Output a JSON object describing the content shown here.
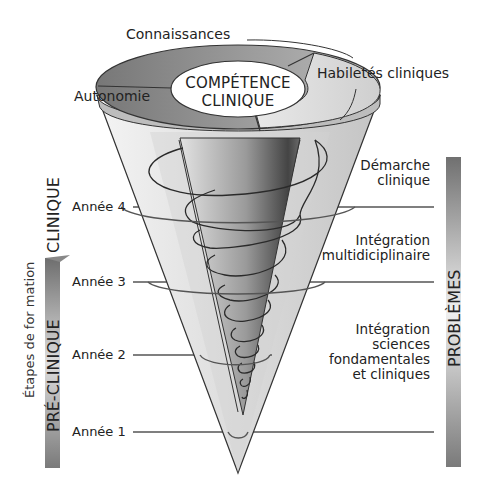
{
  "diagram": {
    "center": {
      "line1": "COMPÉTENCE",
      "line2": "CLINIQUE"
    },
    "rim_segments": {
      "top": "Connaissances",
      "right": "Habiletés cliniques",
      "left": "Autonomie"
    },
    "years": [
      "Année 4",
      "Année 3",
      "Année 2",
      "Année 1"
    ],
    "left_axis": {
      "title": "Étapes de for mation",
      "phase_clinical": "CLINIQUE",
      "phase_preclinical": "PRÉ-CLINIQUE"
    },
    "right_axis": {
      "title": "PROBLÈMES",
      "levels": [
        {
          "line1": "Démarche",
          "line2": "clinique"
        },
        {
          "line1": "Intégration",
          "line2": "multidiciplinaire"
        },
        {
          "line1": "Intégration",
          "line2": "sciences",
          "line3": "fondamentales",
          "line4": "et cliniques"
        }
      ]
    },
    "colors": {
      "rim_dark": "#8a8a8a",
      "rim_light": "#d9d9d9",
      "cone_light": "#e6e6e6",
      "inner_cone_dark": "#5a5a5a",
      "bar_dark": "#777777",
      "bar_light": "#eeeeee"
    }
  }
}
